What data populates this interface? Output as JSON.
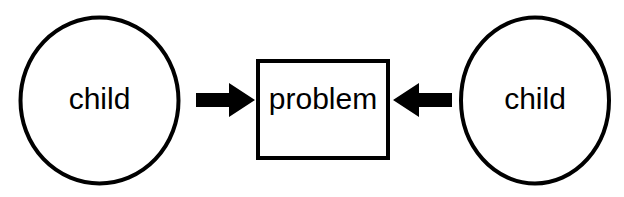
{
  "diagram": {
    "background_color": "#ffffff",
    "stroke_color": "#000000",
    "fill_color": "#ffffff",
    "nodes": [
      {
        "id": "child-left",
        "label": "child",
        "shape": "ellipse",
        "cx": 99.5,
        "cy": 100.5,
        "rx": 79,
        "ry": 83,
        "stroke_width": 4,
        "label_x": 99.5,
        "label_y": 101
      },
      {
        "id": "problem",
        "label": "problem",
        "shape": "rectangle",
        "x": 258,
        "y": 61,
        "width": 130,
        "height": 97,
        "stroke_width": 4,
        "label_x": 323,
        "label_y": 101
      },
      {
        "id": "child-right",
        "label": "child",
        "shape": "ellipse",
        "cx": 535,
        "cy": 100.5,
        "rx": 74,
        "ry": 83,
        "stroke_width": 4,
        "label_x": 535,
        "label_y": 101
      }
    ],
    "arrows": [
      {
        "id": "arrow-left-to-problem",
        "direction": "right",
        "from": "child-left",
        "to": "problem",
        "tail_x": 196,
        "tip_x": 255,
        "center_y": 100,
        "shaft_height": 14,
        "head_height": 34,
        "head_length": 26,
        "points": "196,93 229,93 229,83 255,100 229,117 229,107 196,107"
      },
      {
        "id": "arrow-right-to-problem",
        "direction": "left",
        "from": "child-right",
        "to": "problem",
        "tail_x": 452,
        "tip_x": 393,
        "center_y": 100,
        "shaft_height": 14,
        "head_height": 34,
        "head_length": 26,
        "points": "452,93 419,93 419,83 393,100 419,117 419,107 452,107"
      }
    ]
  }
}
